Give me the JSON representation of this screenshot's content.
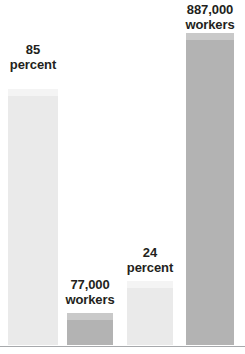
{
  "chart_data": {
    "type": "bar",
    "title": "",
    "subtitle": "",
    "xlabel": "",
    "ylabel": "",
    "grid": false,
    "legend": null,
    "baseline_color": "#a7a9ac",
    "background": "#ffffff",
    "categories": [
      "85 percent",
      "77,000 workers",
      "24 percent",
      "887,000 workers"
    ],
    "values": [
      85,
      77000,
      24,
      887000
    ],
    "bars": [
      {
        "label_line1": "85",
        "label_line2": "percent",
        "value": 85,
        "unit": "percent",
        "front_color": "#eaeaea",
        "top_color": "#f4f4f4",
        "side_color": "#e0e0e0",
        "left": 8,
        "width": 50,
        "height": 249,
        "label_top": 42
      },
      {
        "label_line1": "77,000",
        "label_line2": "workers",
        "value": 77000,
        "unit": "workers",
        "front_color": "#b3b3b3",
        "top_color": "#c9c9c9",
        "side_color": "#a6a6a6",
        "left": 67,
        "width": 46,
        "height": 25,
        "label_top": 277
      },
      {
        "label_line1": "24",
        "label_line2": "percent",
        "value": 24,
        "unit": "percent",
        "front_color": "#eaeaea",
        "top_color": "#f4f4f4",
        "side_color": "#e0e0e0",
        "left": 127,
        "width": 46,
        "height": 57,
        "label_top": 245
      },
      {
        "label_line1": "887,000",
        "label_line2": "workers",
        "value": 887000,
        "unit": "workers",
        "front_color": "#b3b3b3",
        "top_color": "#c9c9c9",
        "side_color": "#a6a6a6",
        "left": 186,
        "width": 48,
        "height": 305,
        "label_top": 2
      }
    ]
  }
}
